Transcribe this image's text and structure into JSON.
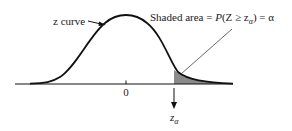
{
  "diagram": {
    "type": "standard-normal-curve-upper-tail",
    "curve_label": "z curve",
    "center_tick_label": "0",
    "critical_value_label": "z",
    "critical_value_subscript": "α",
    "shaded_area_caption": {
      "prefix": "Shaded area = ",
      "expression_P": "P",
      "expression_open": "(Z ≥ z",
      "expression_sub": "α",
      "expression_close": ") = α"
    },
    "colors": {
      "curve": "#111111",
      "shaded_region": "#8a8a8a",
      "pointer": "#444444",
      "background": "#ffffff"
    }
  }
}
